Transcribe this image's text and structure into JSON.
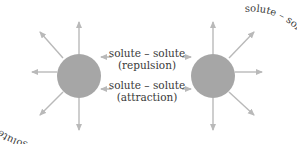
{
  "diagram": {
    "colors": {
      "particle": "#a6a6a6",
      "arrow": "#b9b9b9",
      "text": "#3a3a3a",
      "background": "#ffffff"
    },
    "particles": [
      {
        "id": "left",
        "label": "solute particle",
        "cx": 79,
        "cy": 76,
        "r": 22
      },
      {
        "id": "right",
        "label": "solute particle",
        "cx": 213,
        "cy": 76,
        "r": 22
      }
    ],
    "middle_labels": {
      "repulsion_line1": "solute – solute",
      "repulsion_line2": "(repulsion)",
      "attraction_line1": "solute – solute",
      "attraction_line2": "(attraction)"
    },
    "side_labels": {
      "left": "solute – solvent  (attraction)",
      "right": "solute – solvent – (attraction)"
    }
  }
}
